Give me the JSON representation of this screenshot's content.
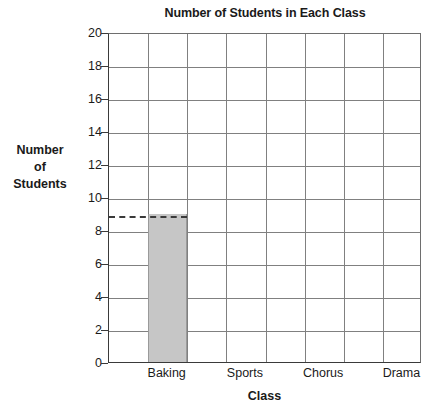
{
  "chart_data": {
    "type": "bar",
    "title": "Number of Students in Each Class",
    "xlabel": "Class",
    "ylabel": "Number of Students",
    "ylabel_lines": [
      "Number",
      "of",
      "Students"
    ],
    "categories": [
      "Baking",
      "Sports",
      "Chorus",
      "Drama"
    ],
    "values": [
      9,
      null,
      null,
      null
    ],
    "ylim": [
      0,
      20
    ],
    "ytick_values": [
      0,
      2,
      4,
      6,
      8,
      10,
      12,
      14,
      16,
      18,
      20
    ],
    "ytick_labels": [
      "0",
      "2",
      "4",
      "6",
      "8",
      "10",
      "12",
      "14",
      "16",
      "18",
      "20"
    ],
    "grid": true,
    "grid_columns": 8,
    "category_column_indices": [
      1,
      3,
      5,
      7
    ],
    "legend": null,
    "annotations": [
      {
        "type": "dashed-reference-line",
        "value": 9,
        "orientation": "horizontal",
        "from_category_index": 0,
        "to_category_index": 0,
        "label": ""
      }
    ],
    "bar_color": "#c6c6c6",
    "grid_color": "#808080",
    "axis_color": "#3a3a3a",
    "background_color": "#ffffff"
  }
}
